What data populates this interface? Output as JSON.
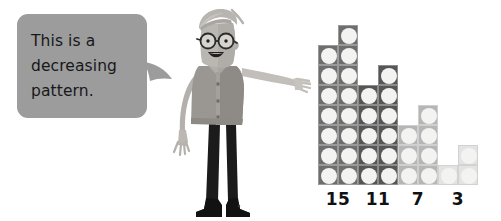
{
  "speech_bubble": {
    "text": "This is a\ndecreasing\npattern.",
    "fill_color": "#9c9c9c",
    "text_color": "#17181a",
    "tail_direction": "right"
  },
  "character": {
    "name": "cartoon-man-pointing",
    "description": "Cartoon man with round glasses and swept-back hair, wearing a collared shirt with buttons and dark trousers, right arm extended pointing toward the dot array",
    "colors": {
      "skin": "#b9b5b0",
      "hair": "#b3b0ab",
      "shirt": "#9a9793",
      "shirt_dark": "#8b8884",
      "trousers": "#1b1b1b",
      "glasses": "#2a2a2a",
      "shoes": "#141414"
    }
  },
  "dot_array": {
    "cell_size": 20,
    "dot_color": "#f3f3f1",
    "groups": [
      {
        "label": "15",
        "count": 15,
        "rows": 7,
        "columns": 2,
        "extra_top_dot": true,
        "fill_color": "#6e6e6e",
        "border_color": "#9a9a9a"
      },
      {
        "label": "11",
        "count": 11,
        "rows": 5,
        "columns": 2,
        "extra_top_dot": true,
        "fill_color": "#565656",
        "border_color": "#8c8c8c"
      },
      {
        "label": "7",
        "count": 7,
        "rows": 3,
        "columns": 2,
        "extra_top_dot": true,
        "fill_color": "#b6b6b6",
        "border_color": "#cfcfcf"
      },
      {
        "label": "3",
        "count": 3,
        "rows": 1,
        "columns": 2,
        "extra_top_dot": true,
        "fill_color": "#e3e3e3",
        "border_color": "#d2d2d2"
      }
    ]
  },
  "chart_data": {
    "type": "bar",
    "title": "This is a decreasing pattern.",
    "categories": [
      "15",
      "11",
      "7",
      "3"
    ],
    "values": [
      15,
      11,
      7,
      3
    ],
    "xlabel": "",
    "ylabel": "",
    "ylim": [
      0,
      15
    ],
    "grid": false,
    "legend": "none",
    "annotations": [
      "This is a decreasing pattern.",
      "Common difference: -4"
    ]
  }
}
